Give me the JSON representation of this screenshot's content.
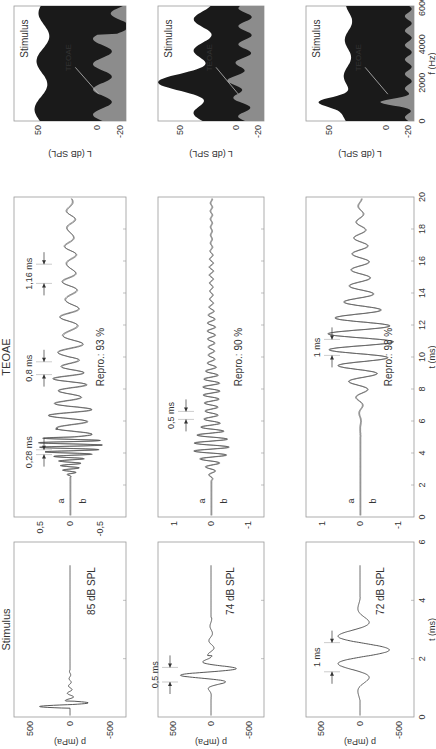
{
  "chart_data": [
    {
      "type": "line",
      "row": 1,
      "panel": "stimulus",
      "title": "Stimulus",
      "annotation": "85 dB SPL",
      "xlabel": "t (ms)",
      "ylabel": "p (mPa)",
      "xlim": [
        0,
        6
      ],
      "ylim": [
        -700,
        700
      ],
      "xticks": [
        0,
        2,
        4,
        6
      ],
      "yticks": [
        500,
        0,
        -500
      ],
      "description": "Broadband click: large spike near 0.4 ms (~+450/-350 mPa) then small ringing until ~1.5 ms, flat afterwards"
    },
    {
      "type": "line",
      "row": 1,
      "panel": "teoae",
      "title": "TEOAE",
      "xlabel": "t (ms)",
      "ylabel": "",
      "xlim": [
        0,
        20
      ],
      "ylim": [
        -0.75,
        0.75
      ],
      "xticks": [
        0,
        2,
        4,
        6,
        8,
        10,
        12,
        14,
        16,
        18,
        20
      ],
      "yticks": [
        0.5,
        0,
        -0.5
      ],
      "ytick_labels": [
        "0,5",
        "0",
        "-0,5"
      ],
      "series": [
        {
          "name": "a"
        },
        {
          "name": "b"
        }
      ],
      "annotations": [
        "0,28 ms",
        "0,8 ms",
        "1,16 ms",
        "Repro.: 93 %"
      ]
    },
    {
      "type": "area",
      "row": 1,
      "panel": "spectrum",
      "title": "Stimulus",
      "ylabel": "L (dB SPL)",
      "xlim": [
        0,
        6000
      ],
      "ylim": [
        -25,
        70
      ],
      "yticks": [
        50,
        0,
        -20
      ],
      "series": [
        {
          "name": "Stimulus",
          "color": "#1a1a1a"
        },
        {
          "name": "TEOAE",
          "color": "#8c8c8c"
        }
      ]
    },
    {
      "type": "line",
      "row": 2,
      "panel": "stimulus",
      "annotation": "74 dB SPL",
      "ylabel": "p (mPa)",
      "xlim": [
        0,
        6
      ],
      "ylim": [
        -700,
        700
      ],
      "yticks": [
        500,
        0,
        -500
      ],
      "annotations": [
        "0,5 ms"
      ],
      "description": "~1 kHz tone burst with period 0.5 ms, peak ~±400 mPa around 1.5 ms"
    },
    {
      "type": "line",
      "row": 2,
      "panel": "teoae",
      "xlim": [
        0,
        20
      ],
      "ylim": [
        -1.3,
        1.3
      ],
      "yticks": [
        1,
        0,
        -1
      ],
      "series": [
        {
          "name": "a"
        },
        {
          "name": "b"
        }
      ],
      "annotations": [
        "0,5 ms",
        "Repro.: 90 %"
      ]
    },
    {
      "type": "area",
      "row": 2,
      "panel": "spectrum",
      "title": "Stimulus",
      "ylabel": "L (dB SPL)",
      "xlim": [
        0,
        6000
      ],
      "ylim": [
        -25,
        70
      ],
      "yticks": [
        50,
        0,
        -20
      ],
      "series": [
        {
          "name": "Stimulus",
          "color": "#1a1a1a"
        },
        {
          "name": "TEOAE",
          "color": "#8c8c8c"
        }
      ]
    },
    {
      "type": "line",
      "row": 3,
      "panel": "stimulus",
      "annotation": "72 dB SPL",
      "xlabel": "t (ms)",
      "ylabel": "p (mPa)",
      "xlim": [
        0,
        6
      ],
      "ylim": [
        -700,
        700
      ],
      "xticks": [
        0,
        2,
        4,
        6
      ],
      "yticks": [
        500,
        0,
        -500
      ],
      "annotations": [
        "1 ms"
      ],
      "description": "~1 kHz tone burst with period 1 ms, peak ~±400 mPa around 2.5 ms"
    },
    {
      "type": "line",
      "row": 3,
      "panel": "teoae",
      "xlabel": "t (ms)",
      "xlim": [
        0,
        20
      ],
      "ylim": [
        -1.3,
        1.3
      ],
      "xticks": [
        0,
        2,
        4,
        6,
        8,
        10,
        12,
        14,
        16,
        18,
        20
      ],
      "yticks": [
        1,
        0,
        -1
      ],
      "series": [
        {
          "name": "a"
        },
        {
          "name": "b"
        }
      ],
      "annotations": [
        "1 ms",
        "Repro.: 98 %"
      ]
    },
    {
      "type": "area",
      "row": 3,
      "panel": "spectrum",
      "title": "Stimulus",
      "xlabel": "f (Hz)",
      "ylabel": "L (dB SPL)",
      "xlim": [
        0,
        6000
      ],
      "ylim": [
        -25,
        70
      ],
      "xticks": [
        0,
        2000,
        4000,
        6000
      ],
      "yticks": [
        50,
        0,
        -20
      ],
      "series": [
        {
          "name": "Stimulus",
          "color": "#1a1a1a"
        },
        {
          "name": "TEOAE",
          "color": "#8c8c8c"
        }
      ]
    }
  ],
  "labels": {
    "stimulus_title": "Stimulus",
    "teoae_title": "TEOAE",
    "t_ms": "t (ms)",
    "f_hz": "f (Hz)",
    "p_mpa": "p (mPa)",
    "l_dbspl": "L (dB SPL)",
    "teoae_in_spectrum": "TEOAE",
    "series_a": "a",
    "series_b": "b",
    "row1": {
      "level": "85 dB SPL",
      "t1": "0,28 ms",
      "t2": "0,8 ms",
      "t3": "1,16 ms",
      "repro": "Repro.: 93 %"
    },
    "row2": {
      "level": "74 dB SPL",
      "stim_t": "0,5 ms",
      "t1": "0,5 ms",
      "repro": "Repro.: 90 %"
    },
    "row3": {
      "level": "72 dB SPL",
      "stim_t": "1 ms",
      "t1": "1 ms",
      "repro": "Repro.: 98 %"
    }
  },
  "ticks": {
    "stim_y": [
      "500",
      "0",
      "-500"
    ],
    "stim_x": [
      "0",
      "2",
      "4",
      "6"
    ],
    "teoae_y1": [
      "0,5",
      "0",
      "-0,5"
    ],
    "teoae_y2": [
      "1",
      "0",
      "-1"
    ],
    "teoae_x": [
      "0",
      "2",
      "4",
      "6",
      "8",
      "10",
      "12",
      "14",
      "16",
      "18",
      "20"
    ],
    "spec_y": [
      "50",
      "0",
      "-20"
    ],
    "spec_x": [
      "0",
      "2000",
      "4000",
      "6000"
    ]
  }
}
